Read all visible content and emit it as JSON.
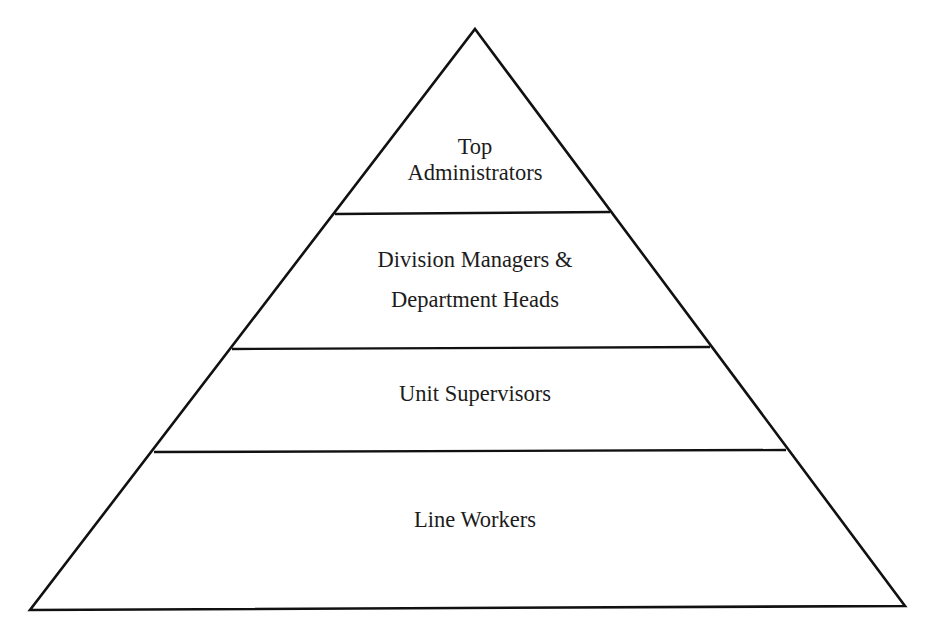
{
  "diagram": {
    "type": "hierarchy-pyramid",
    "stroke_color": "#111111",
    "background_color": "#ffffff",
    "geometry": {
      "apex": [
        475,
        29
      ],
      "bottom_left": [
        30,
        610
      ],
      "bottom_right": [
        905,
        606
      ],
      "dividers": [
        {
          "left": [
            335,
            214
          ],
          "right": [
            610,
            212
          ]
        },
        {
          "left": [
            232,
            349
          ],
          "right": [
            710,
            347
          ]
        },
        {
          "left": [
            154,
            452
          ],
          "right": [
            786,
            450
          ]
        }
      ]
    },
    "tiers": [
      {
        "level": 1,
        "lines": [
          "Top",
          "Administrators"
        ]
      },
      {
        "level": 2,
        "lines": [
          "Division Managers &",
          "Department Heads"
        ]
      },
      {
        "level": 3,
        "lines": [
          "Unit Supervisors"
        ]
      },
      {
        "level": 4,
        "lines": [
          "Line Workers"
        ]
      }
    ]
  }
}
